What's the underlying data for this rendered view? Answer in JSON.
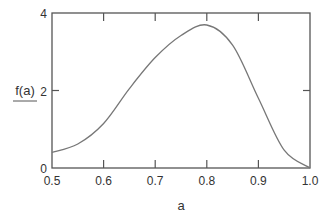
{
  "chart_data": {
    "type": "line",
    "title": "",
    "xlabel": "a",
    "ylabel": "f(a)",
    "xlim": [
      0.5,
      1.0
    ],
    "ylim": [
      0,
      4
    ],
    "grid": false,
    "legend": null,
    "x_ticks": [
      "0.5",
      "0.6",
      "0.7",
      "0.8",
      "0.9",
      "1.0"
    ],
    "y_ticks": [
      "0",
      "2",
      "4"
    ],
    "series": [
      {
        "name": "f(a)",
        "color": "#777777",
        "x": [
          0.5,
          0.55,
          0.6,
          0.65,
          0.7,
          0.75,
          0.8,
          0.85,
          0.9,
          0.95,
          1.0
        ],
        "y": [
          0.4,
          0.62,
          1.15,
          2.05,
          2.85,
          3.42,
          3.69,
          3.17,
          1.8,
          0.46,
          0.0
        ]
      }
    ]
  }
}
